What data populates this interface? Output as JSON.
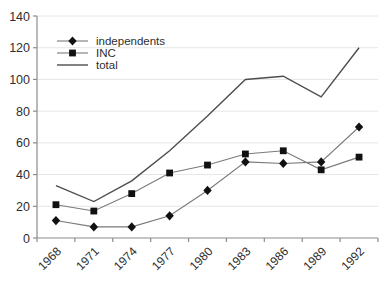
{
  "chart_data": {
    "type": "line",
    "title": "",
    "xlabel": "",
    "ylabel": "",
    "categories": [
      "1968",
      "1971",
      "1974",
      "1977",
      "1980",
      "1983",
      "1986",
      "1989",
      "1992"
    ],
    "series": [
      {
        "name": "independents",
        "marker": "diamond",
        "values": [
          11,
          7,
          7,
          14,
          30,
          48,
          47,
          48,
          70
        ]
      },
      {
        "name": "INC",
        "marker": "square",
        "values": [
          21,
          17,
          28,
          41,
          46,
          53,
          55,
          43,
          51
        ]
      },
      {
        "name": "total",
        "marker": "none",
        "values": [
          33,
          23,
          36,
          55,
          77,
          100,
          102,
          89,
          120
        ]
      }
    ],
    "ylim": [
      0,
      140
    ],
    "ytick_step": 20,
    "ytick_labels": [
      "0",
      "20",
      "40",
      "60",
      "80",
      "100",
      "120",
      "140"
    ],
    "grid": true,
    "legend_position": "top-left-inside"
  },
  "legend": {
    "items": [
      {
        "label": "independents",
        "marker": "diamond"
      },
      {
        "label": "INC",
        "marker": "square"
      },
      {
        "label": "total",
        "marker": "none"
      }
    ]
  },
  "colors": {
    "background": "#ffffff",
    "gridline": "#e6e6e6",
    "axis": "#8c8c8c",
    "tick_label": "#2e2e2e",
    "marker": "#111111",
    "marker_series_line": "#7a7a7a",
    "total_line": "#4d4d4d"
  }
}
